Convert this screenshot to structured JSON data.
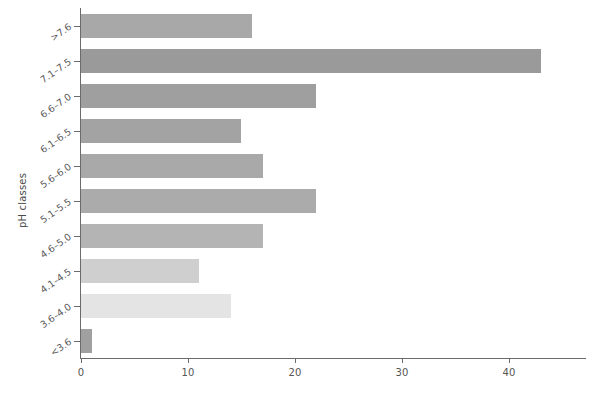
{
  "chart_data": {
    "type": "bar",
    "orientation": "horizontal",
    "title": "",
    "xlabel": "",
    "ylabel": "pH classes",
    "categories": [
      ">7.6",
      "7.1–7.5",
      "6.6–7.0",
      "6.1–6.5",
      "5.6–6.0",
      "5.1–5.5",
      "4.6–5.0",
      "4.1–4.5",
      "3.6–4.0",
      "<3.6"
    ],
    "values": [
      16,
      43,
      22,
      15,
      17,
      22,
      17,
      11,
      14,
      1
    ],
    "bar_colors": [
      "#a8a8a8",
      "#9a9a9a",
      "#9f9f9f",
      "#a3a3a3",
      "#a9a9a9",
      "#ababab",
      "#b4b4b4",
      "#cfcfcf",
      "#e4e4e4",
      "#a0a0a0"
    ],
    "xlim": [
      0,
      47.2
    ],
    "xticks": [
      0,
      10,
      20,
      30,
      40
    ],
    "xtick_labels": [
      "0",
      "10",
      "20",
      "30",
      "40"
    ],
    "grid": false,
    "legend": false,
    "axis_color": "#6b6b6b",
    "tick_label_color": "#555555"
  }
}
